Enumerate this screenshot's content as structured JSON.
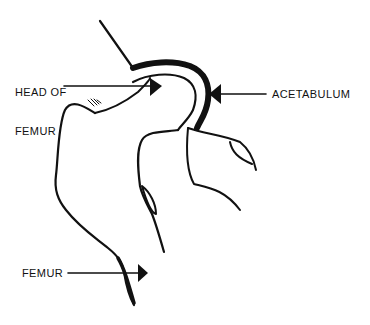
{
  "diagram": {
    "line_color": "#111111",
    "background": "#ffffff",
    "labels": [
      {
        "id": "head_of_femur",
        "line1": "HEAD OF",
        "line2": "FEMUR",
        "points_to": "femoral head"
      },
      {
        "id": "acetabulum",
        "text": "ACETABULUM",
        "points_to": "acetabulum socket"
      },
      {
        "id": "femur",
        "text": "FEMUR",
        "points_to": "femur shaft"
      }
    ]
  }
}
